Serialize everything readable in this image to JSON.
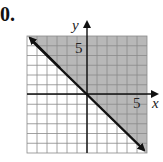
{
  "problem": {
    "number_label": "0."
  },
  "chart_data": {
    "type": "line",
    "title": "",
    "subtitle": "",
    "xlabel": "x",
    "ylabel": "y",
    "xlim": [
      -6,
      6
    ],
    "ylim": [
      -6,
      6
    ],
    "grid": true,
    "grid_step": 1,
    "tick_labels": {
      "x": [
        "5"
      ],
      "y": [
        "5"
      ]
    },
    "tick_values": {
      "x": [
        5
      ],
      "y": [
        5
      ]
    },
    "series": [
      {
        "name": "boundary",
        "equation": "y = -x",
        "style": "solid",
        "arrows": "both",
        "x": [
          -6,
          6
        ],
        "y": [
          6,
          -6
        ]
      }
    ],
    "shaded_region": {
      "inequality": "y >= -x",
      "side": "above",
      "color": "#b8b8b8"
    },
    "legend": null,
    "colors": {
      "shade": "#b8b8b8",
      "grid": "#8a8a8a",
      "line": "#111111",
      "background": "#ffffff"
    }
  }
}
